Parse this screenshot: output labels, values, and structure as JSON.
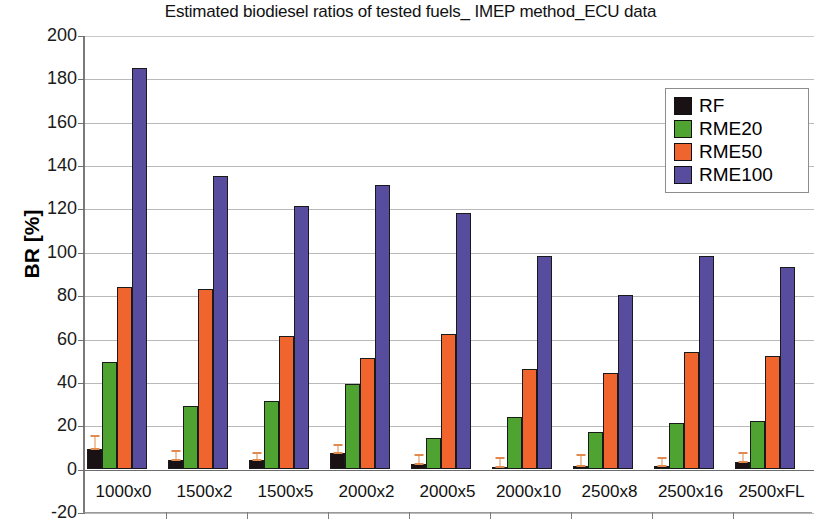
{
  "chart_data": {
    "type": "bar",
    "title": "Estimated biodiesel ratios of tested fuels_ IMEP method_ECU data",
    "xlabel": "",
    "ylabel": "BR [%]",
    "ylim": [
      -20,
      200
    ],
    "ytick_step": 20,
    "yticks": [
      "200",
      "180",
      "160",
      "140",
      "120",
      "100",
      "80",
      "60",
      "40",
      "20",
      "0",
      "-20"
    ],
    "grid": true,
    "legend_position": "top-right",
    "categories": [
      "1000x0",
      "1500x2",
      "1500x5",
      "2000x2",
      "2000x5",
      "2000x10",
      "2500x8",
      "2500x16",
      "2500xFL"
    ],
    "series": [
      {
        "name": "RF",
        "color": "#191114",
        "values": [
          9,
          4,
          4,
          7,
          2,
          0.5,
          1,
          1,
          3
        ],
        "errors": [
          7,
          5,
          4,
          5,
          5,
          5,
          6,
          5,
          5
        ]
      },
      {
        "name": "RME20",
        "color": "#4fa331",
        "values": [
          49,
          29,
          31,
          39,
          14,
          24,
          17,
          21,
          22
        ]
      },
      {
        "name": "RME50",
        "color": "#f0652e",
        "values": [
          84,
          83,
          61,
          51,
          62,
          46,
          44,
          54,
          52
        ]
      },
      {
        "name": "RME100",
        "color": "#584c9e",
        "values": [
          185,
          135,
          121,
          131,
          118,
          98,
          80,
          98,
          93
        ]
      }
    ]
  },
  "legend": {
    "items": [
      {
        "label": "RF",
        "color": "#191114"
      },
      {
        "label": "RME20",
        "color": "#4fa331"
      },
      {
        "label": "RME50",
        "color": "#f0652e"
      },
      {
        "label": "RME100",
        "color": "#584c9e"
      }
    ]
  }
}
